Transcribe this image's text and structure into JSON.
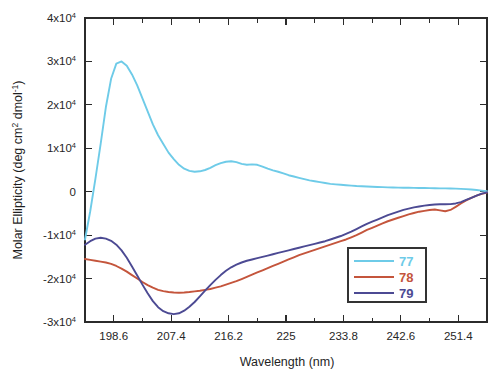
{
  "chart_data": {
    "type": "line",
    "title": "",
    "xlabel": "Wavelength (nm)",
    "ylabel": "Molar Ellipticity (deg cm2 dmol-1)",
    "ylabel_parts": {
      "prefix": "Molar Ellipticity (deg cm",
      "sup1": "2",
      "middle": " dmol",
      "sup2": "-1",
      "suffix": ")"
    },
    "xlim": [
      194.2,
      255.8
    ],
    "ylim": [
      -30000,
      40000
    ],
    "grid": false,
    "legend_position": "lower-right",
    "xticks": [
      198.6,
      207.4,
      216.2,
      225,
      233.8,
      242.6,
      251.4
    ],
    "xticklabels": [
      "198.6",
      "207.4",
      "216.2",
      "225",
      "233.8",
      "242.6",
      "251.4"
    ],
    "xminor_step": 4.4,
    "yticks": [
      -30000,
      -20000,
      -10000,
      0,
      10000,
      20000,
      30000,
      40000
    ],
    "yticklabels": [
      {
        "mantissa": "-3x10",
        "exp": "4"
      },
      {
        "mantissa": "-2x10",
        "exp": "4"
      },
      {
        "mantissa": "-1x10",
        "exp": "4"
      },
      {
        "mantissa": "0",
        "exp": ""
      },
      {
        "mantissa": "1x10",
        "exp": "4"
      },
      {
        "mantissa": "2x10",
        "exp": "4"
      },
      {
        "mantissa": "3x10",
        "exp": "4"
      },
      {
        "mantissa": "4x10",
        "exp": "4"
      }
    ],
    "series": [
      {
        "name": "77",
        "color": "#6ecbe8",
        "x": [
          194.2,
          195.0,
          195.8,
          196.6,
          197.4,
          198.2,
          199.0,
          199.8,
          200.6,
          201.4,
          202.2,
          203.0,
          203.8,
          204.6,
          205.4,
          206.2,
          207.0,
          207.8,
          208.6,
          209.4,
          210.2,
          211.0,
          211.8,
          212.6,
          213.4,
          214.2,
          215.0,
          215.8,
          216.6,
          217.4,
          218.2,
          219.0,
          219.8,
          220.6,
          221.4,
          222.2,
          223.0,
          223.8,
          224.6,
          225.4,
          226.2,
          227.0,
          227.8,
          228.6,
          229.4,
          230.2,
          231.0,
          231.8,
          232.6,
          233.4,
          234.2,
          235.0,
          235.8,
          236.6,
          237.4,
          238.2,
          239.0,
          239.8,
          240.6,
          241.4,
          242.2,
          243.0,
          243.8,
          244.6,
          245.4,
          246.2,
          247.0,
          247.8,
          248.6,
          249.4,
          250.2,
          251.0,
          251.8,
          252.6,
          253.4,
          254.2,
          255.0,
          255.8
        ],
        "y": [
          -11000,
          -4500,
          3000,
          11000,
          19500,
          26000,
          29500,
          30000,
          29000,
          27000,
          24500,
          21500,
          18500,
          15500,
          13000,
          11000,
          9000,
          7500,
          6200,
          5300,
          4800,
          4600,
          4700,
          5000,
          5500,
          6100,
          6600,
          6900,
          7000,
          6800,
          6400,
          6200,
          6300,
          6200,
          5800,
          5300,
          4900,
          4600,
          4200,
          3800,
          3500,
          3200,
          2900,
          2600,
          2400,
          2200,
          2000,
          1800,
          1700,
          1600,
          1500,
          1400,
          1300,
          1250,
          1200,
          1150,
          1100,
          1050,
          1000,
          980,
          950,
          920,
          900,
          880,
          860,
          840,
          820,
          800,
          780,
          760,
          740,
          700,
          650,
          600,
          500,
          400,
          250,
          100
        ]
      },
      {
        "name": "78",
        "color": "#c4553c",
        "x": [
          194.2,
          195.0,
          195.8,
          196.6,
          197.4,
          198.2,
          199.0,
          199.8,
          200.6,
          201.4,
          202.2,
          203.0,
          203.8,
          204.6,
          205.4,
          206.2,
          207.0,
          207.8,
          208.6,
          209.4,
          210.2,
          211.0,
          211.8,
          212.6,
          213.4,
          214.2,
          215.0,
          215.8,
          216.6,
          217.4,
          218.2,
          219.0,
          219.8,
          220.6,
          221.4,
          222.2,
          223.0,
          223.8,
          224.6,
          225.4,
          226.2,
          227.0,
          227.8,
          228.6,
          229.4,
          230.2,
          231.0,
          231.8,
          232.6,
          233.4,
          234.2,
          235.0,
          235.8,
          236.6,
          237.4,
          238.2,
          239.0,
          239.8,
          240.6,
          241.4,
          242.2,
          243.0,
          243.8,
          244.6,
          245.4,
          246.2,
          247.0,
          247.8,
          248.6,
          249.4,
          250.2,
          251.0,
          251.8,
          252.6,
          253.4,
          254.2,
          255.0,
          255.8
        ],
        "y": [
          -15500,
          -15700,
          -15900,
          -16100,
          -16300,
          -16600,
          -17100,
          -17700,
          -18400,
          -19200,
          -20000,
          -20800,
          -21500,
          -22100,
          -22600,
          -22900,
          -23100,
          -23200,
          -23250,
          -23200,
          -23100,
          -22950,
          -22800,
          -22600,
          -22400,
          -22100,
          -21800,
          -21400,
          -21000,
          -20600,
          -20100,
          -19600,
          -19100,
          -18600,
          -18100,
          -17600,
          -17100,
          -16600,
          -16100,
          -15600,
          -15100,
          -14600,
          -14200,
          -13800,
          -13400,
          -13000,
          -12600,
          -12200,
          -11800,
          -11400,
          -11000,
          -10500,
          -10000,
          -9400,
          -8800,
          -8300,
          -7800,
          -7300,
          -6800,
          -6400,
          -6000,
          -5600,
          -5200,
          -4900,
          -4600,
          -4400,
          -4200,
          -4100,
          -4300,
          -4500,
          -4200,
          -3500,
          -2700,
          -2000,
          -1400,
          -900,
          -500,
          -200
        ]
      },
      {
        "name": "79",
        "color": "#4c4a93",
        "x": [
          194.2,
          195.0,
          195.8,
          196.6,
          197.4,
          198.2,
          199.0,
          199.8,
          200.6,
          201.4,
          202.2,
          203.0,
          203.8,
          204.6,
          205.4,
          206.2,
          207.0,
          207.8,
          208.6,
          209.4,
          210.2,
          211.0,
          211.8,
          212.6,
          213.4,
          214.2,
          215.0,
          215.8,
          216.6,
          217.4,
          218.2,
          219.0,
          219.8,
          220.6,
          221.4,
          222.2,
          223.0,
          223.8,
          224.6,
          225.4,
          226.2,
          227.0,
          227.8,
          228.6,
          229.4,
          230.2,
          231.0,
          231.8,
          232.6,
          233.4,
          234.2,
          235.0,
          235.8,
          236.6,
          237.4,
          238.2,
          239.0,
          239.8,
          240.6,
          241.4,
          242.2,
          243.0,
          243.8,
          244.6,
          245.4,
          246.2,
          247.0,
          247.8,
          248.6,
          249.4,
          250.2,
          251.0,
          251.8,
          252.6,
          253.4,
          254.2,
          255.0,
          255.8
        ],
        "y": [
          -12200,
          -11400,
          -10800,
          -10600,
          -10800,
          -11300,
          -12200,
          -13500,
          -15200,
          -17200,
          -19300,
          -21400,
          -23400,
          -25200,
          -26600,
          -27500,
          -28000,
          -28200,
          -28000,
          -27400,
          -26500,
          -25400,
          -24100,
          -22800,
          -21500,
          -20300,
          -19200,
          -18200,
          -17400,
          -16800,
          -16300,
          -15900,
          -15600,
          -15300,
          -15000,
          -14700,
          -14400,
          -14100,
          -13800,
          -13500,
          -13200,
          -12900,
          -12600,
          -12300,
          -12000,
          -11700,
          -11400,
          -11000,
          -10600,
          -10200,
          -9700,
          -9200,
          -8600,
          -8000,
          -7400,
          -6900,
          -6400,
          -5900,
          -5400,
          -5000,
          -4600,
          -4200,
          -3900,
          -3600,
          -3400,
          -3200,
          -3050,
          -2950,
          -2900,
          -2900,
          -2850,
          -2700,
          -2400,
          -1900,
          -1400,
          -900,
          -450,
          -150
        ]
      }
    ],
    "legend": [
      {
        "label": "77",
        "color": "#6ecbe8"
      },
      {
        "label": "78",
        "color": "#c4553c"
      },
      {
        "label": "79",
        "color": "#4c4a93"
      }
    ]
  }
}
